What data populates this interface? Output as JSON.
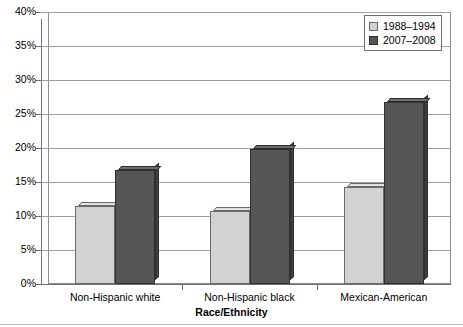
{
  "chart_data": {
    "type": "bar",
    "title": "",
    "subtitle": "",
    "xlabel": "Race/Ethnicity",
    "ylabel": "",
    "categories": [
      "Non-Hispanic white",
      "Non-Hispanic black",
      "Mexican-American"
    ],
    "series": [
      {
        "name": "1988–1994",
        "color": "#d2d2d2",
        "values": [
          11.4,
          10.8,
          14.2
        ]
      },
      {
        "name": "2007–2008",
        "color": "#565656",
        "values": [
          16.8,
          19.8,
          26.7
        ]
      }
    ],
    "ylim": [
      0,
      40
    ],
    "ytick_values": [
      0,
      5,
      10,
      15,
      20,
      25,
      30,
      35,
      40
    ],
    "ytick_labels": [
      "0%",
      "5%",
      "10%",
      "15%",
      "20%",
      "25%",
      "30%",
      "35%",
      "40%"
    ],
    "grid": true,
    "grid_axis": "y",
    "legend_position": "top-right",
    "value_format": "percent"
  },
  "legend": {
    "items": [
      {
        "label": "1988–1994",
        "swatch": "light-gray-swatch"
      },
      {
        "label": "2007–2008",
        "swatch": "dark-gray-swatch"
      }
    ]
  },
  "axes": {
    "x_title": "Race/Ethnicity",
    "x_tick_labels": [
      "Non-Hispanic white",
      "Non-Hispanic black",
      "Mexican-American"
    ],
    "y_tick_labels": [
      "40%",
      "35%",
      "30%",
      "25%",
      "20%",
      "15%",
      "10%",
      "5%",
      "0%"
    ]
  },
  "colors": {
    "series_1988_1994": "#d2d2d2",
    "series_2007_2008": "#565656",
    "gridline": "#a0a0a0",
    "axis": "#6f6f6f",
    "background": "#ffffff"
  }
}
